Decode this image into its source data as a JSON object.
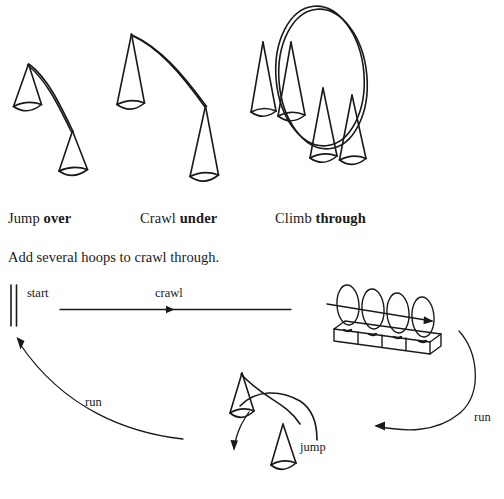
{
  "page": {
    "background_color": "#ffffff",
    "ink_color": "#1a1a1a",
    "width": 504,
    "height": 499
  },
  "captions": [
    {
      "id": "jump-over",
      "plain": "Jump ",
      "bold": "over"
    },
    {
      "id": "crawl-under",
      "plain": "Crawl ",
      "bold": "under"
    },
    {
      "id": "climb-through",
      "plain": "Climb ",
      "bold": "through"
    }
  ],
  "captions_text": {
    "jump_plain": "Jump ",
    "jump_bold": "over",
    "crawl_plain": "Crawl ",
    "crawl_bold": "under",
    "climb_plain": "Climb ",
    "climb_bold": "through"
  },
  "instruction": "Add several hoops to crawl through.",
  "course_labels": {
    "start": "start",
    "crawl": "crawl",
    "run_left": "run",
    "run_right": "run",
    "jump": "jump"
  },
  "figures": {
    "top_row": [
      {
        "name": "jump-over-figure",
        "description": "two cones joined by a draped rope the athlete jumps over",
        "cones": 2,
        "hoops": 0
      },
      {
        "name": "crawl-under-figure",
        "description": "tall cone and short cone with a rope slung between them to crawl under",
        "cones": 2,
        "hoops": 0
      },
      {
        "name": "climb-through-figure",
        "description": "large upright hoop resting against four cones to climb through",
        "cones": 4,
        "hoops": 1
      }
    ],
    "course": {
      "start_gate": {
        "name": "start-gate",
        "lines": 2
      },
      "crawl_lane": {
        "name": "crawl-arrow",
        "direction": "right"
      },
      "hoop_row": {
        "name": "hoop-row",
        "hoops": 4,
        "blocks": 4,
        "direction": "right"
      },
      "run_right": {
        "name": "run-arrow-right",
        "direction": "left"
      },
      "jump_station": {
        "name": "jump-station",
        "cones": 2
      },
      "run_left": {
        "name": "run-arrow-left",
        "direction": "up"
      }
    }
  }
}
